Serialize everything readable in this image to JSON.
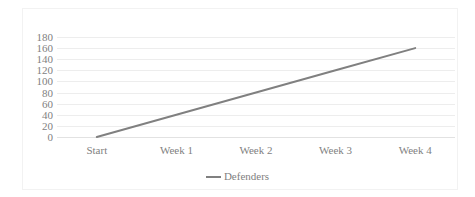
{
  "chart_data": {
    "type": "line",
    "title": "",
    "subtitle": "",
    "xlabel": "",
    "ylabel": "",
    "categories": [
      "Start",
      "Week 1",
      "Week 2",
      "Week 3",
      "Week 4"
    ],
    "series": [
      {
        "name": "Defenders",
        "values": [
          0,
          40,
          80,
          120,
          160
        ],
        "color": "#808080"
      }
    ],
    "ylim": [
      0,
      180
    ],
    "ytick_values": [
      0,
      20,
      40,
      60,
      80,
      100,
      120,
      140,
      160,
      180
    ],
    "ytick_labels": [
      "0",
      "20",
      "40",
      "60",
      "80",
      "100",
      "120",
      "140",
      "160",
      "180"
    ],
    "grid": true,
    "grid_axis": "y",
    "legend_position": "bottom",
    "legend_entries": [
      "Defenders"
    ]
  },
  "style": {
    "line_color": "#808080",
    "text_color": "#7f7f7f",
    "gridline_color": "#ededed",
    "axis_color": "#e2e2e2",
    "background": "#ffffff",
    "border_color": "#f2f2f2"
  }
}
